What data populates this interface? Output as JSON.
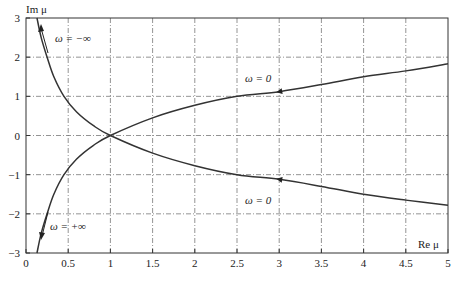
{
  "chart_data": {
    "type": "line",
    "title": "",
    "xlabel": "Re μ",
    "ylabel": "Im μ",
    "xlim": [
      0,
      5
    ],
    "ylim": [
      -3,
      3
    ],
    "grid": true,
    "x_ticks": [
      "0",
      "0.5",
      "1",
      "1.5",
      "2",
      "2.5",
      "3",
      "3.5",
      "4",
      "4.5",
      "5"
    ],
    "y_ticks": [
      "3",
      "2",
      "1",
      "0",
      "-1",
      "-2",
      "-3"
    ],
    "series": [
      {
        "name": "upper branch (ω from −∞ to 0)",
        "points": [
          [
            0.13,
            3
          ],
          [
            0.18,
            2.5
          ],
          [
            0.25,
            2
          ],
          [
            0.33,
            1.5
          ],
          [
            0.45,
            1
          ],
          [
            0.6,
            0.6
          ],
          [
            0.8,
            0.25
          ],
          [
            1,
            0
          ],
          [
            1.5,
            -0.45
          ],
          [
            2,
            -0.77
          ],
          [
            2.5,
            -1.0
          ],
          [
            3,
            -1.12
          ],
          [
            3.5,
            -1.3
          ],
          [
            4,
            -1.5
          ],
          [
            4.5,
            -1.65
          ],
          [
            5,
            -1.78
          ]
        ]
      },
      {
        "name": "lower branch (ω from +∞ to 0)",
        "points": [
          [
            0.13,
            -3
          ],
          [
            0.18,
            -2.5
          ],
          [
            0.25,
            -2
          ],
          [
            0.33,
            -1.5
          ],
          [
            0.45,
            -1
          ],
          [
            0.6,
            -0.6
          ],
          [
            0.8,
            -0.25
          ],
          [
            1,
            0
          ],
          [
            1.5,
            0.45
          ],
          [
            2,
            0.77
          ],
          [
            2.5,
            1.0
          ],
          [
            3,
            1.12
          ],
          [
            3.5,
            1.3
          ],
          [
            4,
            1.5
          ],
          [
            4.5,
            1.65
          ],
          [
            5,
            1.83
          ]
        ]
      }
    ],
    "annotations": [
      {
        "text": "ω = −∞",
        "x": 0.55,
        "y": 2.6
      },
      {
        "text": "ω = +∞",
        "x": 0.55,
        "y": -2.3
      },
      {
        "text": "ω = 0",
        "x": 2.55,
        "y": 1.5
      },
      {
        "text": "ω = 0",
        "x": 2.55,
        "y": -1.55
      }
    ]
  },
  "labels": {
    "ylabel": "Im μ",
    "xlabel": "Re μ",
    "omega_minus_inf": "ω = −∞",
    "omega_plus_inf": "ω = +∞",
    "omega_zero_top": "ω = 0",
    "omega_zero_bottom": "ω = 0"
  }
}
